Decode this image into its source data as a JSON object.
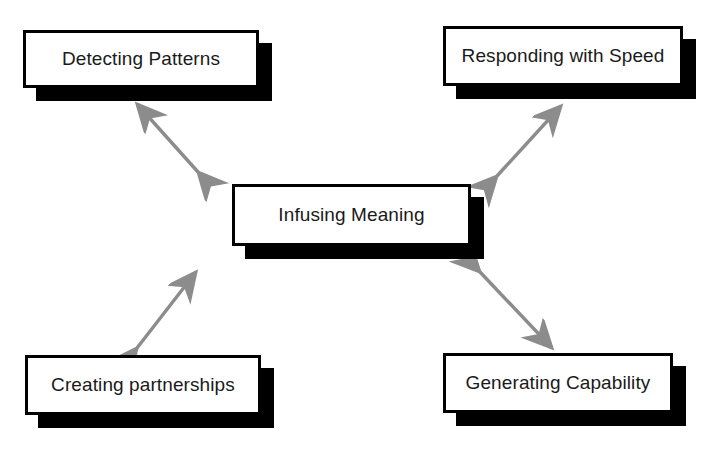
{
  "diagram": {
    "title": "Infusing Meaning",
    "style": {
      "box_fill": "#ffffff",
      "box_border": "#000000",
      "box_shadow": "#000000",
      "arrow_color": "#8c8c8c",
      "text_color": "#1a1a1a",
      "background": "#ffffff"
    },
    "center": {
      "id": "center",
      "label": "Infusing Meaning"
    },
    "nodes": [
      {
        "id": "detecting",
        "label": "Detecting Patterns",
        "position": "top-left"
      },
      {
        "id": "responding",
        "label": "Responding with Speed",
        "position": "top-right"
      },
      {
        "id": "creating",
        "label": "Creating partnerships",
        "position": "bottom-left"
      },
      {
        "id": "generating",
        "label": "Generating Capability",
        "position": "bottom-right"
      }
    ],
    "connectors": [
      {
        "id": "connector-detecting-center",
        "from": "detecting",
        "to": "center",
        "style": "double-headed-arrow"
      },
      {
        "id": "connector-responding-center",
        "from": "responding",
        "to": "center",
        "style": "double-headed-arrow"
      },
      {
        "id": "connector-creating-center",
        "from": "creating",
        "to": "center",
        "style": "double-headed-arrow"
      },
      {
        "id": "connector-generating-center",
        "from": "generating",
        "to": "center",
        "style": "double-headed-arrow"
      }
    ]
  }
}
